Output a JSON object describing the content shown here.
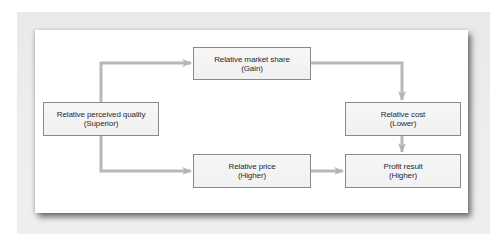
{
  "diagram": {
    "type": "flowchart",
    "colors": {
      "background": "#ececec",
      "panel": "#ffffff",
      "node_fill": "#f3f3f3",
      "node_border": "#8a8a8a",
      "connector": "#b8b8b8",
      "text": "#2a2a2a"
    },
    "nodes": [
      {
        "id": "quality",
        "title": "Relative perceived quality",
        "subtitle": "(Superior)"
      },
      {
        "id": "share",
        "title": "Relative market share",
        "subtitle": "(Gain)"
      },
      {
        "id": "cost",
        "title": "Relative cost",
        "subtitle": "(Lower)"
      },
      {
        "id": "price",
        "title": "Relative price",
        "subtitle": "(Higher)"
      },
      {
        "id": "profit",
        "title": "Profit result",
        "subtitle": "(Higher)"
      }
    ],
    "edges": [
      {
        "from": "quality",
        "to": "share"
      },
      {
        "from": "quality",
        "to": "price"
      },
      {
        "from": "share",
        "to": "cost"
      },
      {
        "from": "cost",
        "to": "profit"
      },
      {
        "from": "price",
        "to": "profit"
      }
    ]
  }
}
